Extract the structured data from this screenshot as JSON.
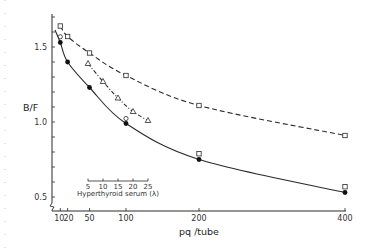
{
  "chart_data": {
    "type": "line",
    "title": "",
    "xlabel": "pq /tube",
    "ylabel": "B/F",
    "xlim": [
      0,
      400
    ],
    "ylim": [
      0.41,
      1.72
    ],
    "x_ticks": [
      10,
      20,
      50,
      100,
      200,
      400
    ],
    "x_tick_labels": [
      "10",
      "20",
      "50",
      "100",
      "200",
      "400"
    ],
    "y_ticks": [
      0.5,
      0.6,
      0.7,
      0.8,
      0.9,
      1.0,
      1.1,
      1.2,
      1.3,
      1.4,
      1.5,
      1.6,
      1.7
    ],
    "y_tick_labels": [
      {
        "value": 0.5,
        "label": "0.5"
      },
      {
        "value": 1.0,
        "label": "1.0"
      },
      {
        "value": 1.5,
        "label": "1.5"
      }
    ],
    "grid": false,
    "axis_break": "y-axis near origin",
    "series": [
      {
        "name": "open squares (dashed)",
        "marker": "open-square",
        "line": "dashed",
        "x": [
          10,
          20,
          50,
          100,
          200,
          400
        ],
        "y": [
          1.64,
          1.57,
          1.46,
          1.31,
          1.11,
          0.91
        ]
      },
      {
        "name": "filled circles (solid)",
        "marker": "filled-circle",
        "line": "solid",
        "x": [
          10,
          20,
          50,
          100,
          200,
          400
        ],
        "y": [
          1.53,
          1.4,
          1.23,
          0.99,
          0.75,
          0.53
        ]
      },
      {
        "name": "Hyperthyroid serum (dash-dot)",
        "marker": "open-triangle",
        "line": "dash-dot",
        "x_scale": "inset",
        "x": [
          5,
          10,
          15,
          20,
          25
        ],
        "y": [
          1.39,
          1.27,
          1.16,
          1.07,
          1.01
        ]
      }
    ],
    "overlay_markers": [
      {
        "marker": "open-circle",
        "x": 10,
        "y": 1.555
      },
      {
        "marker": "open-circle",
        "x": 100,
        "y": 1.01
      },
      {
        "marker": "open-square",
        "x": 200,
        "y": 0.775
      },
      {
        "marker": "open-square",
        "x": 400,
        "y": 0.555
      }
    ],
    "inset_axis": {
      "label": "Hyperthyroid serum (λ)",
      "ticks": [
        5,
        10,
        15,
        20,
        25
      ],
      "tick_labels": [
        "5",
        "10",
        "15",
        "20",
        "25"
      ]
    }
  }
}
